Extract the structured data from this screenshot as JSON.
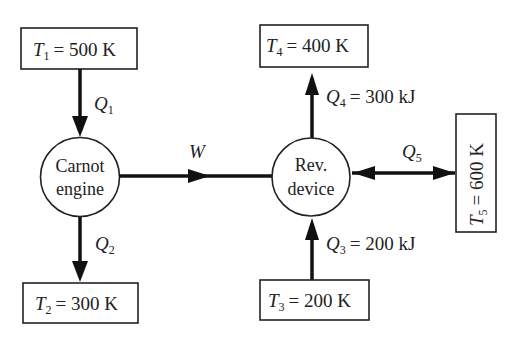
{
  "diagram": {
    "reservoirs": {
      "T1": {
        "symbol": "T",
        "sub": "1",
        "value": "= 500 K"
      },
      "T2": {
        "symbol": "T",
        "sub": "2",
        "value": "= 300 K"
      },
      "T3": {
        "symbol": "T",
        "sub": "3",
        "value": "= 200 K"
      },
      "T4": {
        "symbol": "T",
        "sub": "4",
        "value": "= 400 K"
      },
      "T5": {
        "symbol": "T",
        "sub": "5",
        "value": "= 600 K"
      }
    },
    "devices": {
      "carnot": {
        "line1": "Carnot",
        "line2": "engine"
      },
      "rev": {
        "line1": "Rev.",
        "line2": "device"
      }
    },
    "flows": {
      "Q1": {
        "symbol": "Q",
        "sub": "1",
        "value": ""
      },
      "Q2": {
        "symbol": "Q",
        "sub": "2",
        "value": ""
      },
      "Q3": {
        "symbol": "Q",
        "sub": "3",
        "value": "= 200 kJ"
      },
      "Q4": {
        "symbol": "Q",
        "sub": "4",
        "value": "= 300 kJ"
      },
      "Q5": {
        "symbol": "Q",
        "sub": "5",
        "value": ""
      },
      "W": {
        "symbol": "W"
      }
    }
  }
}
